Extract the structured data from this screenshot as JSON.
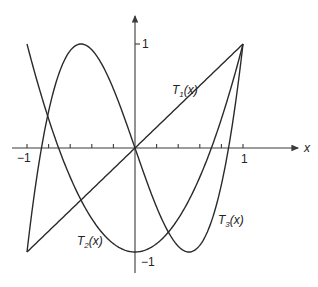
{
  "chart_data": {
    "type": "line",
    "title": "",
    "xlabel": "x",
    "ylabel": "",
    "xlim": [
      -1,
      1
    ],
    "ylim": [
      -1,
      1
    ],
    "grid": false,
    "x_ticks": [
      -1,
      -0.8,
      -0.6,
      -0.4,
      -0.2,
      0,
      0.2,
      0.4,
      0.6,
      0.8,
      1
    ],
    "x_tick_labels": {
      "-1": "-1",
      "1": "1"
    },
    "y_tick_labels": {
      "1": "1",
      "-1": "-1"
    },
    "series": [
      {
        "name": "T_1(x)",
        "formula": "x",
        "points": [
          [
            -1,
            -1
          ],
          [
            0,
            0
          ],
          [
            1,
            1
          ]
        ]
      },
      {
        "name": "T_2(x)",
        "formula": "2x^2-1",
        "points": [
          [
            -1,
            1
          ],
          [
            -0.707,
            0
          ],
          [
            0,
            -1
          ],
          [
            0.707,
            0
          ],
          [
            1,
            1
          ]
        ]
      },
      {
        "name": "T_3(x)",
        "formula": "4x^3-3x",
        "points": [
          [
            -1,
            -1
          ],
          [
            -0.866,
            0
          ],
          [
            -0.5,
            1
          ],
          [
            0,
            0
          ],
          [
            0.5,
            -1
          ],
          [
            0.866,
            0
          ],
          [
            1,
            1
          ]
        ]
      }
    ],
    "annotations": [
      {
        "text": "T1(x)",
        "at": [
          0.5,
          0.55
        ]
      },
      {
        "text": "T2(x)",
        "at": [
          -0.3,
          -0.85
        ]
      },
      {
        "text": "T3(x)",
        "at": [
          0.72,
          -0.7
        ]
      }
    ]
  },
  "labels": {
    "x_axis": "x",
    "tick_neg1_x": "−1",
    "tick_pos1_x": "1",
    "tick_pos1_y": "1",
    "tick_neg1_y": "−1",
    "T1_main": "T",
    "T1_sub": "1",
    "T1_arg": "(x)",
    "T2_main": "T",
    "T2_sub": "2",
    "T2_arg": "(x)",
    "T3_main": "T",
    "T3_sub": "3",
    "T3_arg": "(x)"
  }
}
